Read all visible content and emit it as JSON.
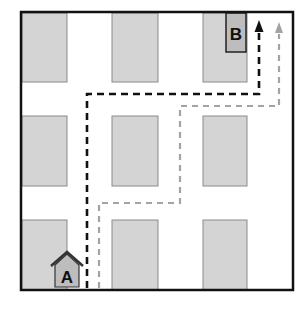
{
  "diagram": {
    "type": "city-grid-route-map",
    "colors": {
      "background": "#ffffff",
      "border": "#111111",
      "block_fill": "#d4d4d4",
      "block_stroke": "#8a8a8a",
      "route_primary": "#111111",
      "route_alternate": "#a3a3a3",
      "marker_fill": "#bdbdbd"
    },
    "markers": {
      "start": {
        "label": "A"
      },
      "end": {
        "label": "B"
      }
    },
    "routes": [
      {
        "name": "primary",
        "style": "black dashed",
        "color": "#111111"
      },
      {
        "name": "alternate",
        "style": "gray dashed",
        "color": "#a3a3a3"
      }
    ],
    "grid": {
      "rows": 3,
      "cols": 3
    }
  }
}
